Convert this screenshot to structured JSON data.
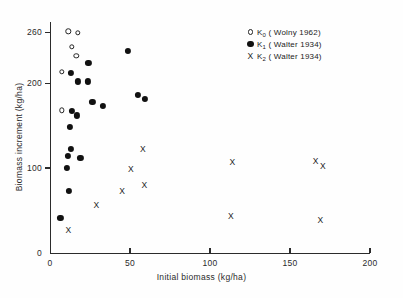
{
  "chart_data": {
    "type": "scatter",
    "title": "",
    "xlabel": "Initial biomass (kg/ha)",
    "ylabel": "Biomass increment (kg/ha)",
    "xlim": [
      0,
      200
    ],
    "ylim": [
      0,
      272
    ],
    "xticks": [
      0,
      50,
      100,
      150,
      200
    ],
    "xticklabels": [
      "0",
      "50",
      "100",
      "150",
      "200"
    ],
    "yticks": [
      0,
      100,
      200,
      260
    ],
    "yticklabels": [
      "0",
      "100",
      "200",
      "260"
    ],
    "grid": false,
    "legend_position": "upper right",
    "series": [
      {
        "name": "K0",
        "legend_prefix": "K",
        "legend_sub": "0",
        "legend_suffix": "( Wolny 1962)",
        "marker": "open-circle",
        "color": "#232323",
        "points": [
          [
            11.5,
            261
          ],
          [
            17.5,
            259
          ],
          [
            13.5,
            243
          ],
          [
            16.5,
            232
          ],
          [
            7.5,
            213
          ],
          [
            7.5,
            168
          ]
        ]
      },
      {
        "name": "K1",
        "legend_prefix": "K",
        "legend_sub": "1",
        "legend_suffix": "( Walter 1934)",
        "marker": "filled-circle",
        "color": "#111111",
        "points": [
          [
            48.5,
            238
          ],
          [
            24.0,
            224
          ],
          [
            13.0,
            212
          ],
          [
            17.5,
            202
          ],
          [
            23.5,
            202
          ],
          [
            55.0,
            186
          ],
          [
            59.5,
            181
          ],
          [
            26.5,
            178
          ],
          [
            33.0,
            173
          ],
          [
            13.5,
            167
          ],
          [
            17.0,
            162
          ],
          [
            12.5,
            148
          ],
          [
            13.0,
            123
          ],
          [
            11.0,
            114
          ],
          [
            19.0,
            112
          ],
          [
            10.5,
            100
          ],
          [
            12.0,
            73
          ],
          [
            6.5,
            41
          ]
        ]
      },
      {
        "name": "K2",
        "legend_prefix": "K",
        "legend_sub": "2",
        "legend_suffix": "( Walter 1934)",
        "marker": "cross",
        "color": "#232323",
        "points": [
          [
            58.0,
            122
          ],
          [
            114.0,
            107
          ],
          [
            166.0,
            108
          ],
          [
            170.5,
            103
          ],
          [
            50.5,
            99
          ],
          [
            59.0,
            80
          ],
          [
            45.0,
            73
          ],
          [
            29.0,
            56
          ],
          [
            113.0,
            43
          ],
          [
            169.0,
            39
          ],
          [
            11.5,
            27
          ]
        ]
      }
    ]
  }
}
